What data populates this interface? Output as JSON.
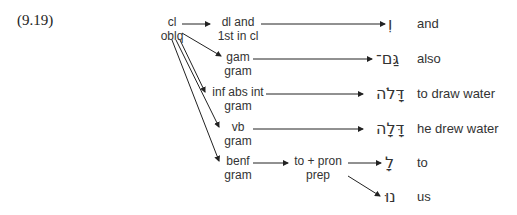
{
  "example_number": "(9.19)",
  "nodes": {
    "root": {
      "line1": "cl",
      "line2": "oblq"
    },
    "dl": {
      "line1": "dl and",
      "line2": "1st in cl"
    },
    "gam": {
      "line1": "gam",
      "line2": "gram"
    },
    "inf": {
      "line1": "inf abs int",
      "line2": "gram"
    },
    "vb": {
      "line1": "vb",
      "line2": "gram"
    },
    "benf": {
      "line1": "benf",
      "line2": "gram"
    },
    "prep": {
      "line1": "to + pron",
      "line2": "prep"
    }
  },
  "leaves": [
    {
      "hebrew": "וְ",
      "gloss": "and"
    },
    {
      "hebrew": "גַּם־",
      "gloss": "also"
    },
    {
      "hebrew": "דָּלֹה",
      "gloss": "to draw water"
    },
    {
      "hebrew": "דָּלָה",
      "gloss": "he drew water"
    },
    {
      "hebrew": "לָ",
      "gloss": "to"
    },
    {
      "hebrew": "נוּ",
      "gloss": "us"
    }
  ]
}
